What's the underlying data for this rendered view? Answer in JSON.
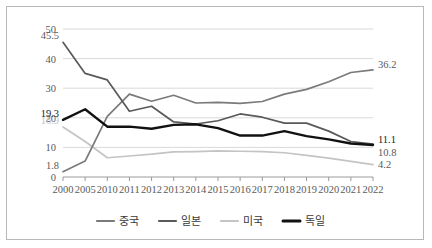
{
  "chart_data": {
    "type": "line",
    "title": "",
    "xlabel": "",
    "ylabel": "",
    "ylim": [
      0,
      50
    ],
    "yticks": [
      0,
      10,
      20,
      30,
      40,
      50
    ],
    "grid": true,
    "legend_position": "bottom",
    "categories": [
      "2000",
      "2005",
      "2010",
      "2011",
      "2012",
      "2013",
      "2014",
      "2015",
      "2016",
      "2017",
      "2018",
      "2019",
      "2020",
      "2021",
      "2022"
    ],
    "series": [
      {
        "name": "중국",
        "color": "#7a7a7a",
        "values": [
          1.8,
          5.4,
          20.5,
          28.0,
          25.6,
          27.6,
          25.0,
          25.2,
          24.9,
          25.5,
          28.0,
          29.6,
          32.2,
          35.3,
          36.2
        ],
        "start_label": "1.8",
        "end_label": "36.2"
      },
      {
        "name": "일본",
        "color": "#595959",
        "values": [
          45.5,
          35.0,
          32.8,
          22.2,
          23.9,
          18.6,
          17.9,
          19.0,
          21.3,
          20.2,
          18.2,
          18.2,
          15.5,
          12.0,
          11.1
        ],
        "start_label": "45.5",
        "end_label": "11.1"
      },
      {
        "name": "미국",
        "color": "#c4c4c4",
        "values": [
          16.9,
          12.0,
          6.5,
          7.1,
          7.7,
          8.5,
          8.6,
          8.8,
          8.7,
          8.6,
          8.2,
          7.3,
          6.4,
          5.3,
          4.2
        ],
        "start_label": "16.9",
        "end_label": "4.2"
      },
      {
        "name": "독일",
        "color": "#111111",
        "values": [
          19.3,
          22.9,
          17.0,
          17.0,
          16.3,
          17.6,
          17.8,
          16.5,
          14.0,
          14.0,
          15.5,
          13.8,
          12.7,
          11.3,
          10.8
        ],
        "start_label": "19.3",
        "end_label": "10.8"
      }
    ],
    "right_labels": [
      {
        "text": "36.2",
        "value": 36.2,
        "style": "normal"
      },
      {
        "text": "11.1",
        "value": 11.1,
        "style": "dark"
      },
      {
        "text": "10.8",
        "value": 10.8,
        "style": "normal"
      },
      {
        "text": "4.2",
        "value": 4.2,
        "style": "normal"
      }
    ],
    "left_labels": [
      {
        "text": "45.5",
        "value": 45.5,
        "style": "normal"
      },
      {
        "text": "19.3",
        "value": 19.3,
        "style": "dark"
      },
      {
        "text": "16.9",
        "value": 16.9,
        "style": "light"
      },
      {
        "text": "1.8",
        "value": 1.8,
        "style": "normal"
      }
    ],
    "legend": [
      {
        "label": "중국",
        "color": "#7a7a7a"
      },
      {
        "label": "일본",
        "color": "#595959"
      },
      {
        "label": "미국",
        "color": "#c4c4c4"
      },
      {
        "label": "독일",
        "color": "#111111"
      }
    ]
  }
}
